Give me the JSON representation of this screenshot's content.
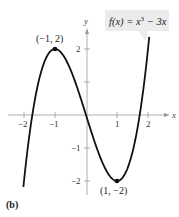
{
  "chart_data": {
    "type": "line",
    "title": "",
    "function": "f(x) = x^3 - 3x",
    "label_parts": {
      "prefix": "f(x) = x",
      "sup": "3",
      "suffix": " − 3x"
    },
    "xlabel": "x",
    "ylabel": "y",
    "xlim": [
      -2.2,
      2.4
    ],
    "ylim": [
      -2.4,
      2.6
    ],
    "x_ticks": [
      -2,
      -1,
      1,
      2
    ],
    "x_tick_labels": [
      "−2",
      "−1",
      "1",
      "2"
    ],
    "y_ticks": [
      -2,
      -1,
      1,
      2
    ],
    "y_tick_labels": [
      "−2",
      "−1",
      "",
      "2"
    ],
    "grid": false,
    "series": [
      {
        "name": "f(x) = x^3 - 3x",
        "x": [
          -2.0,
          -1.5,
          -1.0,
          -0.5,
          0.0,
          0.5,
          1.0,
          1.5,
          2.0,
          2.1
        ],
        "y": [
          -2.0,
          1.125,
          2.0,
          1.375,
          0.0,
          -1.375,
          -2.0,
          -1.125,
          2.0,
          2.961
        ]
      }
    ],
    "annotations": [
      {
        "label": "(−1, 2)",
        "x": -1,
        "y": 2,
        "type": "local maximum"
      },
      {
        "label": "(1, −2)",
        "x": 1,
        "y": -2,
        "type": "local minimum"
      }
    ],
    "panel_label": "(b)"
  }
}
